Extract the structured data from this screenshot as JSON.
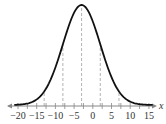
{
  "chart_data": {
    "type": "line",
    "title": "",
    "xlabel": "x",
    "ylabel": "",
    "distribution": "normal",
    "mean": -3,
    "std_dev": 5,
    "xlim": [
      -21,
      16
    ],
    "x_ticks": [
      -20,
      -15,
      -10,
      -5,
      0,
      5,
      10,
      15
    ],
    "x_tick_labels": [
      "−20",
      "−15",
      "−10",
      "−5",
      "0",
      "5",
      "10",
      "15"
    ],
    "minor_tick_step": 2.5,
    "dashed_reference_lines_x": [
      -13,
      -8,
      -3,
      2,
      7
    ],
    "grid": false,
    "legend": "none",
    "colors": {
      "curve": "#111111",
      "axis": "#888888",
      "dashed": "#aaaaaa",
      "text": "#333333"
    }
  }
}
